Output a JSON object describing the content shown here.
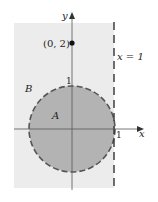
{
  "diagram": {
    "labels": {
      "y_axis": "y",
      "x_axis": "x",
      "point": "(0, 2)",
      "line": "x = 1",
      "region_b": "B",
      "region_a": "A",
      "y_tick_1": "1",
      "x_tick_1": "1"
    },
    "colors": {
      "region_b": "#ececec",
      "region_a": "#b3b3b3",
      "stroke": "#444444"
    },
    "geometry": {
      "origin_px": [
        72,
        129
      ],
      "unit_px": 43,
      "circle_center": [
        0,
        0
      ],
      "circle_radius": 1,
      "point": [
        0,
        2
      ],
      "vertical_line_x": 1
    }
  }
}
